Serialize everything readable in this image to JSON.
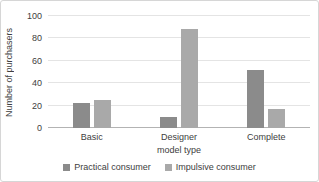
{
  "chart_data": {
    "type": "bar",
    "title": "",
    "categories": [
      "Basic",
      "Designer",
      "Complete"
    ],
    "series": [
      {
        "name": "Practical consumer",
        "color": "#8b8b8b",
        "values": [
          22,
          10,
          52
        ]
      },
      {
        "name": "Impulsive consumer",
        "color": "#a9a9a9",
        "values": [
          25,
          88,
          17
        ]
      }
    ],
    "xlabel": "model type",
    "ylabel": "Number of purchasers",
    "ylim": [
      0,
      100
    ],
    "yticks": [
      0,
      20,
      40,
      60,
      80,
      100
    ],
    "grid": true,
    "legend_position": "bottom"
  }
}
